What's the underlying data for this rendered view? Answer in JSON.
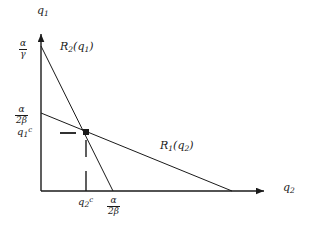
{
  "figure": {
    "type": "cournot-reaction-functions-diagram",
    "background_color": "#ffffff",
    "line_color": "#1a1a1a",
    "width": 318,
    "height": 227
  },
  "axes": {
    "y_axis": {
      "name": "q",
      "name_sub": "1",
      "origin_px": [
        41,
        191
      ],
      "tip_px": [
        41,
        31
      ]
    },
    "x_axis": {
      "name": "q",
      "name_sub": "2",
      "origin_px": [
        41,
        191
      ],
      "tip_px": [
        268,
        191
      ]
    }
  },
  "y_ticks": [
    {
      "id": "alpha-over-gamma",
      "numerator": "α",
      "denominator": "γ",
      "value_px_y": 46
    },
    {
      "id": "alpha-over-2beta",
      "numerator": "α",
      "denominator": "2β",
      "value_px_y": 113
    },
    {
      "id": "q1-cournot",
      "base": "q",
      "sub": "1",
      "sup": "c",
      "value_px_y": 133
    }
  ],
  "x_ticks": [
    {
      "id": "q2-cournot",
      "base": "q",
      "sub": "2",
      "sup": "c",
      "value_px_x": 86
    },
    {
      "id": "alpha-over-2beta-x",
      "numerator": "α",
      "denominator": "2β",
      "value_px_x": 113
    }
  ],
  "curves": [
    {
      "id": "R2",
      "label_base": "R",
      "label_sub": "2",
      "label_arg_base": "q",
      "label_arg_sub": "1",
      "label_open": "(",
      "label_close": ")",
      "from_px": [
        41,
        46
      ],
      "to_px": [
        113,
        191
      ],
      "label_px": [
        63,
        46
      ]
    },
    {
      "id": "R1",
      "label_base": "R",
      "label_sub": "1",
      "label_arg_base": "q",
      "label_arg_sub": "2",
      "label_open": "(",
      "label_close": ")",
      "from_px": [
        41,
        113
      ],
      "to_px": [
        232,
        191
      ],
      "label_px": [
        160,
        142
      ]
    }
  ],
  "equilibrium": {
    "id": "cournot-equilibrium-point",
    "px": [
      86,
      132
    ],
    "marker": "filled-square-dot"
  },
  "guides": [
    {
      "id": "horizontal-guide-dash",
      "x1": 60,
      "y1": 133,
      "x2": 76,
      "y2": 133
    },
    {
      "id": "vertical-guide-dash-upper",
      "x1": 86,
      "y1": 140,
      "x2": 86,
      "y2": 156
    },
    {
      "id": "vertical-guide-dash-lower",
      "x1": 86,
      "y1": 170,
      "x2": 86,
      "y2": 191
    }
  ]
}
